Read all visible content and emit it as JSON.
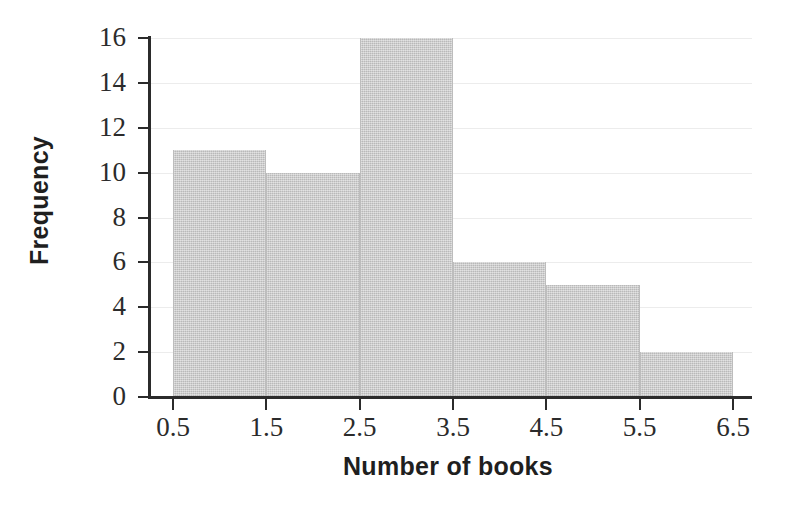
{
  "chart_data": {
    "type": "bar",
    "title": "",
    "xlabel": "Number of books",
    "ylabel": "Frequency",
    "categories": [
      "0.5-1.5",
      "1.5-2.5",
      "2.5-3.5",
      "3.5-4.5",
      "4.5-5.5",
      "5.5-6.5"
    ],
    "bin_edges": [
      0.5,
      1.5,
      2.5,
      3.5,
      4.5,
      5.5,
      6.5
    ],
    "values": [
      11,
      10,
      16,
      6,
      5,
      2
    ],
    "xlim": [
      0.5,
      6.5
    ],
    "ylim": [
      0,
      16
    ],
    "xticks": [
      "0.5",
      "1.5",
      "2.5",
      "3.5",
      "4.5",
      "5.5",
      "6.5"
    ],
    "yticks": [
      "0",
      "2",
      "4",
      "6",
      "8",
      "10",
      "12",
      "14",
      "16"
    ],
    "grid": true,
    "legend": false,
    "bar_color": "#c9c9c9",
    "axis_color": "#2b2b2b",
    "grid_color": "#ececec"
  }
}
